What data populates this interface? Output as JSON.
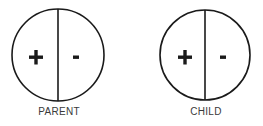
{
  "diagram": {
    "stroke_color": "#1a1a1a",
    "circles": [
      {
        "id": "parent",
        "label": "PARENT",
        "left_sign": "+",
        "right_sign": "-",
        "cx": 58,
        "cy": 55,
        "r": 46
      },
      {
        "id": "child",
        "label": "CHILD",
        "left_sign": "+",
        "right_sign": "-",
        "cx": 205,
        "cy": 55,
        "r": 45
      }
    ]
  }
}
